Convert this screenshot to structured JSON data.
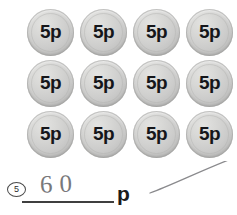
{
  "worksheet": {
    "question_number": "5",
    "coin_grid": {
      "rows": 3,
      "columns": 4,
      "coin_face_value": "5p",
      "total_coins": 12,
      "rows_data": [
        {
          "coins": [
            "5p",
            "5p",
            "5p",
            "5p"
          ]
        },
        {
          "coins": [
            "5p",
            "5p",
            "5p",
            "5p"
          ]
        },
        {
          "coins": [
            "5p",
            "5p",
            "5p",
            "5p"
          ]
        }
      ]
    },
    "answer": {
      "handwritten_value": "60",
      "unit_label": "p",
      "line_placeholder": ""
    },
    "colors": {
      "coin_light": "#e3e3e1",
      "coin_mid": "#cccccb",
      "coin_dark": "#a8a8a7",
      "coin_text": "#15161a",
      "handwriting": "#6d6d70",
      "ink": "#1b1b1b",
      "paper": "#ffffff"
    }
  }
}
